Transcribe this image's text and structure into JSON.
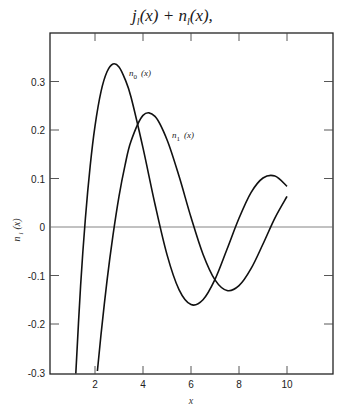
{
  "chart_data": {
    "type": "line",
    "title_parts": {
      "j": "j",
      "j_sub": "l",
      "n": "n",
      "n_sub": "l"
    },
    "xlabel": "x",
    "ylabel": "n_l (x)",
    "xlim": [
      0.15,
      11.8
    ],
    "ylim": [
      -0.3,
      0.4
    ],
    "x_ticks": [
      2,
      4,
      6,
      8,
      10
    ],
    "x_tick_labels": [
      "2",
      "4",
      "6",
      "8",
      "10"
    ],
    "y_ticks": [
      0.3,
      0.2,
      0.1,
      0,
      -0.1,
      -0.2,
      -0.3
    ],
    "y_tick_labels": [
      "0.3",
      "0.2",
      "0.1",
      "0",
      "-0.1",
      "-0.2",
      "-0.3"
    ],
    "grid": false,
    "zero_line": true,
    "series": [
      {
        "name": "n_0 (x)",
        "label_sub": "0",
        "x": [
          1.2,
          1.4,
          1.6,
          1.8,
          2.0,
          2.25,
          2.5,
          2.75,
          3.0,
          3.25,
          3.5,
          4.0,
          4.5,
          5.0,
          5.5,
          6.0,
          6.5,
          7.0,
          7.5,
          8.0,
          8.5,
          9.0,
          9.5,
          10.0
        ],
        "values": [
          -0.302,
          -0.121,
          0.018,
          0.126,
          0.208,
          0.279,
          0.32,
          0.336,
          0.33,
          0.305,
          0.268,
          0.163,
          0.047,
          -0.057,
          -0.129,
          -0.16,
          -0.15,
          -0.108,
          -0.046,
          0.018,
          0.071,
          0.101,
          0.105,
          0.084
        ]
      },
      {
        "name": "n_1 (x)",
        "label_sub": "1",
        "x": [
          2.1,
          2.25,
          2.5,
          2.75,
          3.0,
          3.25,
          3.5,
          4.0,
          4.5,
          5.0,
          5.5,
          6.0,
          6.5,
          7.0,
          7.5,
          8.0,
          8.5,
          9.0,
          9.5,
          10.0
        ],
        "values": [
          -0.297,
          -0.222,
          -0.111,
          -0.017,
          0.063,
          0.127,
          0.177,
          0.23,
          0.228,
          0.18,
          0.105,
          0.02,
          -0.056,
          -0.109,
          -0.131,
          -0.121,
          -0.086,
          -0.035,
          0.019,
          0.063
        ]
      }
    ],
    "annotations": [
      {
        "text": "n_0 (x)",
        "x": 3.5,
        "y": 0.32
      },
      {
        "text": "n_1 (x)",
        "x": 5.2,
        "y": 0.19
      }
    ]
  },
  "labels": {
    "n0_main": "n",
    "n0_sub": "0",
    "n0_arg": "(x)",
    "n1_main": "n",
    "n1_sub": "1",
    "n1_arg": "(x)",
    "ylabel_main": "n",
    "ylabel_sub": "l",
    "ylabel_arg": "(x)",
    "xlabel": "x"
  }
}
